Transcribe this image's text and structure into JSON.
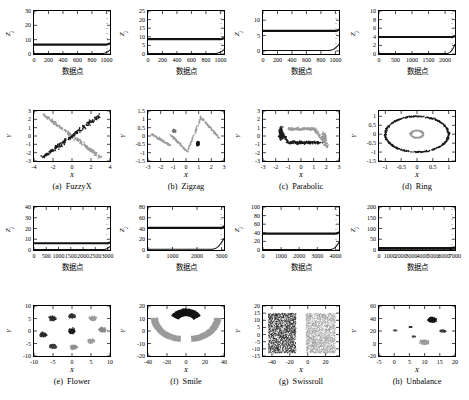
{
  "figure": {
    "columns": 4,
    "rows": 2,
    "axis_label_x_cn": "数据点",
    "axis_label_y": "Z",
    "axis_label_y_sub": "j",
    "scatter_xlabel": "X",
    "scatter_ylabel": "Y",
    "colors": {
      "cluster_dark": "#1a1a1a",
      "cluster_light": "#9a9a9a",
      "cluster_mid": "#4d4d4d",
      "axis": "#000000",
      "background": "#ffffff"
    }
  },
  "panels": [
    {
      "key": "fuzzyx",
      "caption_letter": "(a)",
      "caption_name": "FuzzyX",
      "chart_data": {
        "type": "line",
        "title": "",
        "xlabel": "数据点",
        "ylabel": "Zj",
        "xlim": [
          0,
          1050
        ],
        "ylim": [
          0,
          30
        ],
        "xticks": [
          0,
          200,
          400,
          600,
          800,
          1000
        ],
        "yticks": [
          0,
          10,
          20,
          30
        ],
        "grid": false,
        "series": [
          {
            "name": "upper-threshold",
            "constant_value": 6.6,
            "rise_start_x": 990,
            "rise_end_y": 7.6
          },
          {
            "name": "lower-curve",
            "constant_value": 0.25,
            "rise_start_x": 930,
            "rise_end_y": 3.0
          }
        ]
      }
    },
    {
      "key": "zigzag",
      "caption_letter": "(b)",
      "caption_name": "Zigzag",
      "chart_data": {
        "type": "line",
        "title": "",
        "xlabel": "数据点",
        "ylabel": "Zj",
        "xlim": [
          0,
          1050
        ],
        "ylim": [
          0,
          25
        ],
        "xticks": [
          0,
          200,
          400,
          600,
          800,
          1000
        ],
        "yticks": [
          0,
          5,
          10,
          15,
          20,
          25
        ],
        "grid": false,
        "series": [
          {
            "name": "upper-threshold",
            "constant_value": 8.6,
            "rise_start_x": 995,
            "rise_end_y": 9.4
          },
          {
            "name": "lower-curve",
            "constant_value": 0.3,
            "rise_start_x": 920,
            "rise_end_y": 2.6
          }
        ]
      }
    },
    {
      "key": "parabolic",
      "caption_letter": "(c)",
      "caption_name": "Parabolic",
      "chart_data": {
        "type": "line",
        "title": "",
        "xlabel": "数据点",
        "ylabel": "Zj",
        "xlim": [
          0,
          1050
        ],
        "ylim": [
          -1,
          13
        ],
        "xticks": [
          0,
          200,
          400,
          600,
          800,
          1000
        ],
        "yticks": [
          0,
          5,
          10
        ],
        "grid": false,
        "series": [
          {
            "name": "upper-threshold",
            "constant_value": 6.5,
            "rise_start_x": 995,
            "rise_end_y": 7.0
          },
          {
            "name": "lower-curve",
            "constant_value": 0.15,
            "rise_start_x": 900,
            "rise_end_y": 2.2
          }
        ]
      }
    },
    {
      "key": "ring",
      "caption_letter": "(d)",
      "caption_name": "Ring",
      "chart_data": {
        "type": "line",
        "title": "",
        "xlabel": "数据点",
        "ylabel": "Zj",
        "xlim": [
          0,
          2300
        ],
        "ylim": [
          0,
          10
        ],
        "xticks": [
          0,
          500,
          1000,
          1500,
          2000
        ],
        "yticks": [
          0,
          2,
          4,
          6,
          8,
          10
        ],
        "grid": false,
        "series": [
          {
            "name": "upper-threshold",
            "constant_value": 3.95,
            "rise_start_x": 2180,
            "rise_end_y": 4.3
          },
          {
            "name": "lower-curve",
            "constant_value": 0.12,
            "rise_start_x": 2050,
            "rise_end_y": 2.3
          }
        ]
      }
    },
    {
      "key": "flower",
      "caption_letter": "(e)",
      "caption_name": "Flower",
      "chart_data": {
        "type": "line",
        "title": "",
        "xlabel": "数据点",
        "ylabel": "Zj",
        "xlim": [
          0,
          3100
        ],
        "ylim": [
          0,
          40
        ],
        "xticks": [
          0,
          500,
          1000,
          1500,
          2000,
          2500,
          3000
        ],
        "yticks": [
          0,
          10,
          20,
          30,
          40
        ],
        "grid": false,
        "series": [
          {
            "name": "upper-threshold",
            "constant_value": 6.3,
            "rise_start_x": 2980,
            "rise_end_y": 7.2
          },
          {
            "name": "lower-curve",
            "constant_value": 0.4,
            "rise_start_x": 2800,
            "rise_end_y": 3.4
          }
        ]
      }
    },
    {
      "key": "smile",
      "caption_letter": "(f)",
      "caption_name": "Smile",
      "chart_data": {
        "type": "line",
        "title": "",
        "xlabel": "数据点",
        "ylabel": "Zj",
        "xlim": [
          0,
          3100
        ],
        "ylim": [
          0,
          80
        ],
        "xticks": [
          0,
          1000,
          2000,
          3000
        ],
        "yticks": [
          0,
          20,
          40,
          60,
          80
        ],
        "grid": false,
        "series": [
          {
            "name": "upper-threshold",
            "constant_value": 41,
            "rise_start_x": 2980,
            "rise_end_y": 45
          },
          {
            "name": "lower-curve",
            "constant_value": 1.5,
            "rise_start_x": 2600,
            "rise_end_y": 22
          }
        ]
      }
    },
    {
      "key": "swissroll",
      "caption_letter": "(g)",
      "caption_name": "Swissroll",
      "chart_data": {
        "type": "line",
        "title": "",
        "xlabel": "数据点",
        "ylabel": "Zj",
        "xlim": [
          0,
          4200
        ],
        "ylim": [
          0,
          100
        ],
        "xticks": [
          0,
          1000,
          2000,
          3000,
          4000
        ],
        "yticks": [
          0,
          20,
          40,
          60,
          80,
          100
        ],
        "grid": false,
        "series": [
          {
            "name": "upper-threshold",
            "constant_value": 38,
            "rise_start_x": 4000,
            "rise_end_y": 42
          },
          {
            "name": "lower-curve",
            "constant_value": 1.2,
            "rise_start_x": 3700,
            "rise_end_y": 18
          }
        ]
      }
    },
    {
      "key": "unbalance",
      "caption_letter": "(h)",
      "caption_name": "Unbalance",
      "chart_data": {
        "type": "line",
        "title": "",
        "xlabel": "数据点",
        "ylabel": "Zj",
        "xlim": [
          0,
          7000
        ],
        "ylim": [
          0,
          200
        ],
        "xticks": [
          0,
          1000,
          2000,
          3000,
          4000,
          5000,
          6000,
          7000
        ],
        "yticks": [
          0,
          50,
          100,
          150,
          200
        ],
        "grid": false,
        "series": [
          {
            "name": "upper-threshold",
            "constant_value": 9,
            "rise_start_x": 6450,
            "rise_end_y": 12
          },
          {
            "name": "lower-curve",
            "constant_value": 1.0,
            "rise_start_x": 6200,
            "rise_end_y": 6
          }
        ]
      }
    }
  ],
  "scatters": [
    {
      "key": "fuzzyx",
      "chart_data": {
        "type": "scatter",
        "xlabel": "X",
        "ylabel": "Y",
        "xlim": [
          -4,
          4
        ],
        "ylim": [
          -3,
          3
        ],
        "xticks": [
          -4,
          -2,
          0,
          2,
          4
        ],
        "yticks": [
          -3,
          -2,
          -1,
          0,
          1,
          2,
          3
        ],
        "grid": false,
        "series": [
          {
            "name": "cluster-dark-diagonal",
            "color": "#1a1a1a",
            "n": 200,
            "shape": "diagonal-up"
          },
          {
            "name": "cluster-light-diagonal",
            "color": "#9a9a9a",
            "n": 200,
            "shape": "diagonal-down"
          }
        ]
      }
    },
    {
      "key": "zigzag",
      "chart_data": {
        "type": "scatter",
        "xlabel": "X",
        "ylabel": "Y",
        "xlim": [
          -3,
          3
        ],
        "ylim": [
          -1.5,
          1.5
        ],
        "xticks": [
          -3,
          -2,
          -1,
          0,
          1,
          2,
          3
        ],
        "yticks": [
          -1.5,
          -1,
          -0.5,
          0,
          0.5,
          1,
          1.5
        ],
        "grid": false,
        "series": [
          {
            "name": "cluster-light-zigzag",
            "color": "#9a9a9a",
            "n": 260,
            "shape": "zigzag"
          },
          {
            "name": "cluster-mid-blob",
            "color": "#6a6a6a",
            "n": 60,
            "shape": "blob-left"
          },
          {
            "name": "cluster-dark-blob",
            "color": "#1a1a1a",
            "n": 80,
            "shape": "blob-right"
          }
        ]
      }
    },
    {
      "key": "parabolic",
      "chart_data": {
        "type": "scatter",
        "xlabel": "X",
        "ylabel": "Y",
        "xlim": [
          -3,
          3
        ],
        "ylim": [
          -3,
          3
        ],
        "xticks": [
          -3,
          -2,
          -1,
          0,
          1,
          2,
          3
        ],
        "yticks": [
          -3,
          -2,
          -1,
          0,
          1,
          2,
          3
        ],
        "grid": false,
        "series": [
          {
            "name": "cluster-dark-parabola",
            "color": "#1a1a1a",
            "n": 250,
            "shape": "parabola-left"
          },
          {
            "name": "cluster-light-parabola",
            "color": "#9a9a9a",
            "n": 250,
            "shape": "parabola-right"
          }
        ]
      }
    },
    {
      "key": "ring",
      "chart_data": {
        "type": "scatter",
        "xlabel": "X",
        "ylabel": "Y",
        "xlim": [
          -1.2,
          1.2
        ],
        "ylim": [
          -1.5,
          1.3
        ],
        "xticks": [
          -1,
          -0.5,
          0,
          0.5,
          1
        ],
        "yticks": [
          -1.5,
          -1,
          -0.5,
          0,
          0.5,
          1
        ],
        "grid": false,
        "series": [
          {
            "name": "cluster-dark-outer-ring",
            "color": "#1a1a1a",
            "n": 400,
            "radius": 1.0
          },
          {
            "name": "cluster-light-inner-ring",
            "color": "#9a9a9a",
            "n": 120,
            "radius": 0.22
          }
        ]
      }
    },
    {
      "key": "flower",
      "chart_data": {
        "type": "scatter",
        "xlabel": "X",
        "ylabel": "Y",
        "xlim": [
          -10,
          10
        ],
        "ylim": [
          -10,
          10
        ],
        "xticks": [
          -10,
          -5,
          0,
          5,
          10
        ],
        "yticks": [
          -10,
          -5,
          0,
          5,
          10
        ],
        "grid": false,
        "series": [
          {
            "name": "cluster-center",
            "color": "#1a1a1a",
            "cx": 0,
            "cy": 0
          },
          {
            "name": "cluster-petal-1",
            "color": "#2a2a2a",
            "cx": -5,
            "cy": 5
          },
          {
            "name": "cluster-petal-2",
            "color": "#333333",
            "cx": 0,
            "cy": 6
          },
          {
            "name": "cluster-petal-3",
            "color": "#9a9a9a",
            "cx": 5.5,
            "cy": 5
          },
          {
            "name": "cluster-petal-4",
            "color": "#8a8a8a",
            "cx": 8,
            "cy": 0.5
          },
          {
            "name": "cluster-petal-5",
            "color": "#9a9a9a",
            "cx": 5,
            "cy": -4
          },
          {
            "name": "cluster-petal-6",
            "color": "#8f8f8f",
            "cx": 0.5,
            "cy": -6.5
          },
          {
            "name": "cluster-petal-7",
            "color": "#3a3a3a",
            "cx": -5,
            "cy": -6
          },
          {
            "name": "cluster-petal-8",
            "color": "#2a2a2a",
            "cx": -7.5,
            "cy": -1.5
          }
        ]
      }
    },
    {
      "key": "smile",
      "chart_data": {
        "type": "scatter",
        "xlabel": "X",
        "ylabel": "Y",
        "xlim": [
          -40,
          40
        ],
        "ylim": [
          -20,
          20
        ],
        "xticks": [
          -40,
          -20,
          0,
          20,
          40
        ],
        "yticks": [
          -20,
          -10,
          0,
          10,
          20
        ],
        "grid": false,
        "series": [
          {
            "name": "cluster-dark-top-arc",
            "color": "#111111",
            "n": 900
          },
          {
            "name": "cluster-light-left-arc",
            "color": "#9a9a9a",
            "n": 900
          },
          {
            "name": "cluster-light-right-arc",
            "color": "#9a9a9a",
            "n": 900
          }
        ]
      }
    },
    {
      "key": "swissroll",
      "chart_data": {
        "type": "scatter",
        "xlabel": "X",
        "ylabel": "Y",
        "xlim": [
          -50,
          35
        ],
        "ylim": [
          -15,
          20
        ],
        "xticks": [
          -40,
          -20,
          0,
          20
        ],
        "yticks": [
          -15,
          -10,
          -5,
          0,
          5,
          10,
          15,
          20
        ],
        "grid": false,
        "series": [
          {
            "name": "cluster-dark-left-block",
            "color": "#1f1f1f",
            "n": 1800
          },
          {
            "name": "cluster-light-right-block",
            "color": "#9a9a9a",
            "n": 1800
          }
        ]
      }
    },
    {
      "key": "unbalance",
      "chart_data": {
        "type": "scatter",
        "xlabel": "X",
        "ylabel": "Y",
        "xlim": [
          -5,
          20
        ],
        "ylim": [
          -20,
          60
        ],
        "xticks": [
          -5,
          0,
          5,
          10,
          15,
          20
        ],
        "yticks": [
          -20,
          0,
          20,
          40,
          60
        ],
        "grid": false,
        "series": [
          {
            "name": "cluster-dense-dark",
            "color": "#111111",
            "cx": 12.5,
            "cy": 38,
            "n": 1800
          },
          {
            "name": "cluster-sparse-a",
            "color": "#555555",
            "cx": 0.3,
            "cy": 21,
            "n": 80
          },
          {
            "name": "cluster-sparse-b",
            "color": "#333333",
            "cx": 5.3,
            "cy": 26.5,
            "n": 90
          },
          {
            "name": "cluster-sparse-c",
            "color": "#444444",
            "cx": 6.5,
            "cy": 11,
            "n": 80
          },
          {
            "name": "cluster-mid-right",
            "color": "#3a3a3a",
            "cx": 16,
            "cy": 20,
            "n": 300
          },
          {
            "name": "cluster-light-bottom",
            "color": "#9a9a9a",
            "cx": 10,
            "cy": 2,
            "n": 900
          }
        ]
      }
    }
  ]
}
